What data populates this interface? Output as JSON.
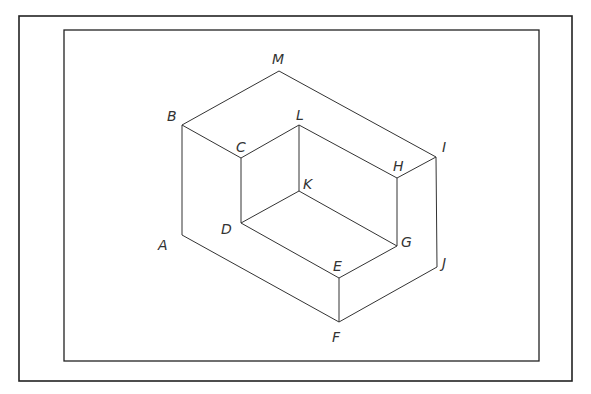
{
  "diagram": {
    "type": "isometric-block-drawing",
    "outer_frame": {
      "x": 19,
      "y": 16,
      "w": 553,
      "h": 365
    },
    "inner_frame": {
      "x": 64,
      "y": 30,
      "w": 475,
      "h": 331
    },
    "vertices": {
      "M": [
        279,
        71
      ],
      "B": [
        182,
        125
      ],
      "C": [
        241,
        158
      ],
      "L": [
        299,
        125
      ],
      "H": [
        397,
        178
      ],
      "I": [
        436,
        157
      ],
      "K": [
        299,
        191
      ],
      "D": [
        241,
        223
      ],
      "A": [
        182,
        235
      ],
      "E": [
        339,
        278
      ],
      "G": [
        397,
        246
      ],
      "J": [
        437,
        267
      ],
      "F": [
        339,
        322
      ]
    },
    "labels": [
      {
        "text": "M",
        "x": 272,
        "y": 64
      },
      {
        "text": "B",
        "x": 167,
        "y": 121
      },
      {
        "text": "C",
        "x": 236,
        "y": 152
      },
      {
        "text": "L",
        "x": 296,
        "y": 120
      },
      {
        "text": "H",
        "x": 393,
        "y": 171
      },
      {
        "text": "I",
        "x": 442,
        "y": 152
      },
      {
        "text": "K",
        "x": 303,
        "y": 189
      },
      {
        "text": "D",
        "x": 221,
        "y": 234
      },
      {
        "text": "A",
        "x": 158,
        "y": 250
      },
      {
        "text": "E",
        "x": 333,
        "y": 271
      },
      {
        "text": "G",
        "x": 401,
        "y": 247
      },
      {
        "text": "J",
        "x": 442,
        "y": 268
      },
      {
        "text": "F",
        "x": 332,
        "y": 342
      }
    ]
  }
}
